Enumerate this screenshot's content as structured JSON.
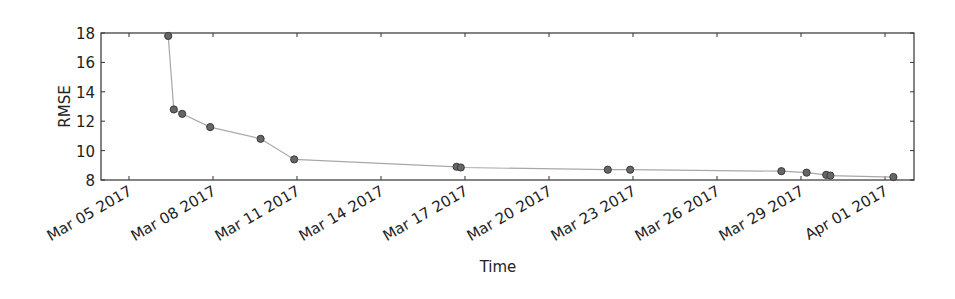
{
  "chart_data": {
    "type": "line",
    "title": "",
    "xlabel": "Time",
    "ylabel": "RMSE",
    "ylim": [
      8,
      18
    ],
    "xlim": [
      "2017-03-04",
      "2017-04-02"
    ],
    "yticks": [
      8,
      10,
      12,
      14,
      16,
      18
    ],
    "xticks": [
      {
        "label": "Mar 05 2017",
        "day": 0
      },
      {
        "label": "Mar 08 2017",
        "day": 3
      },
      {
        "label": "Mar 11 2017",
        "day": 6
      },
      {
        "label": "Mar 14 2017",
        "day": 9
      },
      {
        "label": "Mar 17 2017",
        "day": 12
      },
      {
        "label": "Mar 20 2017",
        "day": 15
      },
      {
        "label": "Mar 23 2017",
        "day": 18
      },
      {
        "label": "Mar 26 2017",
        "day": 21
      },
      {
        "label": "Mar 29 2017",
        "day": 24
      },
      {
        "label": "Apr 01 2017",
        "day": 27
      }
    ],
    "grid": false,
    "legend": null,
    "series": [
      {
        "name": "RMSE",
        "line_color": "#a8a8a8",
        "marker_color": "#666666",
        "marker_edge_color": "#3a3a3a",
        "points": [
          {
            "x": "2017-03-06",
            "day": 1.4,
            "y": 17.8
          },
          {
            "x": "2017-03-06",
            "day": 1.6,
            "y": 12.8
          },
          {
            "x": "2017-03-06",
            "day": 1.9,
            "y": 12.5
          },
          {
            "x": "2017-03-07",
            "day": 2.9,
            "y": 11.6
          },
          {
            "x": "2017-03-09",
            "day": 4.7,
            "y": 10.8
          },
          {
            "x": "2017-03-10",
            "day": 5.9,
            "y": 9.4
          },
          {
            "x": "2017-03-16",
            "day": 11.7,
            "y": 8.9
          },
          {
            "x": "2017-03-16",
            "day": 11.85,
            "y": 8.85
          },
          {
            "x": "2017-03-22",
            "day": 17.1,
            "y": 8.7
          },
          {
            "x": "2017-03-22",
            "day": 17.9,
            "y": 8.7
          },
          {
            "x": "2017-03-28",
            "day": 23.3,
            "y": 8.6
          },
          {
            "x": "2017-03-29",
            "day": 24.2,
            "y": 8.5
          },
          {
            "x": "2017-03-29",
            "day": 24.9,
            "y": 8.35
          },
          {
            "x": "2017-03-30",
            "day": 25.05,
            "y": 8.3
          },
          {
            "x": "2017-04-01",
            "day": 27.3,
            "y": 8.2
          }
        ]
      }
    ]
  },
  "layout": {
    "plot_left": 101,
    "plot_right": 914,
    "plot_top": 33,
    "plot_bottom": 180,
    "day0_x": 129,
    "px_per_day": 28
  }
}
